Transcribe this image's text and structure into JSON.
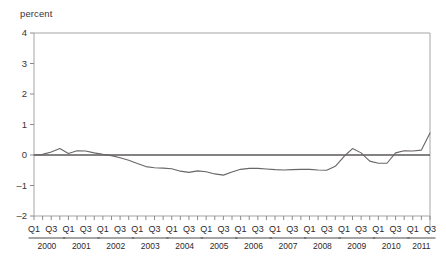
{
  "title": "",
  "axis": {
    "unit_label": "percent",
    "y_ticks": [
      "4",
      "3",
      "2",
      "1",
      "0",
      "-1",
      "-2"
    ],
    "quarter_labels": [
      "Q1",
      "Q3"
    ],
    "years": [
      "2000",
      "2001",
      "2002",
      "2003",
      "2004",
      "2005",
      "2006",
      "2007",
      "2008",
      "2009",
      "2010",
      "2011"
    ]
  },
  "colors": {
    "series": "#6a6568",
    "zero_line": "#5d585b",
    "frame": "#a7a4a6",
    "text": "#2e292c",
    "background": "#ffffff"
  },
  "chart_data": {
    "type": "line",
    "title": "",
    "xlabel": "",
    "ylabel": "percent",
    "ylim": [
      -2,
      4
    ],
    "ytick_values": [
      4,
      3,
      2,
      1,
      0,
      -1,
      -2
    ],
    "grid": false,
    "legend": "none",
    "zero_reference_line": 0,
    "x": [
      "2000 Q1",
      "2000 Q2",
      "2000 Q3",
      "2000 Q4",
      "2001 Q1",
      "2001 Q2",
      "2001 Q3",
      "2001 Q4",
      "2002 Q1",
      "2002 Q2",
      "2002 Q3",
      "2002 Q4",
      "2003 Q1",
      "2003 Q2",
      "2003 Q3",
      "2003 Q4",
      "2004 Q1",
      "2004 Q2",
      "2004 Q3",
      "2004 Q4",
      "2005 Q1",
      "2005 Q2",
      "2005 Q3",
      "2005 Q4",
      "2006 Q1",
      "2006 Q2",
      "2006 Q3",
      "2006 Q4",
      "2007 Q1",
      "2007 Q2",
      "2007 Q3",
      "2007 Q4",
      "2008 Q1",
      "2008 Q2",
      "2008 Q3",
      "2008 Q4",
      "2009 Q1",
      "2009 Q2",
      "2009 Q3",
      "2009 Q4",
      "2010 Q1",
      "2010 Q2",
      "2010 Q3",
      "2010 Q4",
      "2011 Q1",
      "2011 Q2",
      "2011 Q3"
    ],
    "series": [
      {
        "name": "percent",
        "values": [
          0.0,
          0.02,
          0.1,
          0.21,
          0.05,
          0.14,
          0.13,
          0.07,
          0.02,
          -0.02,
          -0.09,
          -0.17,
          -0.28,
          -0.38,
          -0.42,
          -0.43,
          -0.45,
          -0.53,
          -0.57,
          -0.52,
          -0.55,
          -0.62,
          -0.66,
          -0.56,
          -0.47,
          -0.44,
          -0.44,
          -0.46,
          -0.48,
          -0.49,
          -0.48,
          -0.47,
          -0.47,
          -0.49,
          -0.5,
          -0.37,
          -0.05,
          0.21,
          0.07,
          -0.2,
          -0.27,
          -0.27,
          0.07,
          0.14,
          0.13,
          0.16,
          0.72
        ]
      }
    ]
  }
}
